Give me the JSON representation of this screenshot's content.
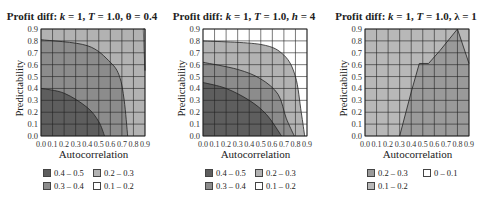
{
  "colors": {
    "0.4-0.5": "#5e5e5e",
    "0.3-0.4": "#8c8c8c",
    "0.2-0.3": "#b2b2b2",
    "0.1-0.2": "#ffffff",
    "0-0.1": "#ffffff",
    "panel3_0.2-0.3": "#9a9a9a",
    "panel3_0.1-0.2": "#b8b8b8"
  },
  "panels": [
    {
      "title_prefix": "Profit diff: ",
      "title_k": "k",
      "title_k_val": " = 1, ",
      "title_T": "T",
      "title_T_val": " = 1.0, ",
      "title_param": "θ",
      "title_param_val": " = 0.4",
      "xlabel": "Autocorrelation",
      "ylabel": "Predictability",
      "legend": [
        {
          "label": "0.4 – 0.5",
          "color": "#5e5e5e"
        },
        {
          "label": "0.2 – 0.3",
          "color": "#b2b2b2"
        },
        {
          "label": "0.3 – 0.4",
          "color": "#8c8c8c"
        },
        {
          "label": "0.1 – 0.2",
          "color": "#ffffff"
        }
      ]
    },
    {
      "title_prefix": "Profit diff: ",
      "title_k": "k",
      "title_k_val": " = 1, ",
      "title_T": "T",
      "title_T_val": " = 1.0, ",
      "title_param": "h",
      "title_param_val": " = 4",
      "xlabel": "Autocorrelation",
      "ylabel": "Predictability",
      "legend": [
        {
          "label": "0.4 – 0.5",
          "color": "#5e5e5e"
        },
        {
          "label": "0.2 – 0.3",
          "color": "#b2b2b2"
        },
        {
          "label": "0.3 – 0.4",
          "color": "#8c8c8c"
        },
        {
          "label": "0.1 – 0.2",
          "color": "#ffffff"
        }
      ]
    },
    {
      "title_prefix": "Profit diff: ",
      "title_k": "k",
      "title_k_val": " = 1, ",
      "title_T": "T",
      "title_T_val": " = 1.0, ",
      "title_param": "λ",
      "title_param_val": " = 1",
      "xlabel": "Autocorrelation",
      "ylabel": "Predictability",
      "legend": [
        {
          "label": "0.2 – 0.3",
          "color": "#9a9a9a"
        },
        {
          "label": "0 – 0.1",
          "color": "#ffffff"
        },
        {
          "label": "0.1 – 0.2",
          "color": "#b8b8b8"
        }
      ]
    }
  ],
  "ticks": [
    "0.0",
    "0.1",
    "0.2",
    "0.3",
    "0.4",
    "0.5",
    "0.6",
    "0.7",
    "0.8",
    "0.9"
  ],
  "chart_data": [
    {
      "type": "heatmap",
      "title": "Profit diff: k = 1, T = 1.0, θ = 0.4",
      "xlabel": "Autocorrelation",
      "ylabel": "Predictability",
      "xlim": [
        0,
        0.9
      ],
      "ylim": [
        0,
        0.9
      ],
      "grid": true,
      "legend_position": "bottom",
      "levels": [
        "0.4 – 0.5",
        "0.3 – 0.4",
        "0.2 – 0.3",
        "0.1 – 0.2"
      ],
      "contours": [
        {
          "level": "0.4 – 0.5",
          "boundary": [
            [
              0,
              0.4
            ],
            [
              0.2,
              0.36
            ],
            [
              0.4,
              0.24
            ],
            [
              0.5,
              0.12
            ],
            [
              0.55,
              0
            ]
          ]
        },
        {
          "level": "0.3 – 0.4",
          "boundary": [
            [
              0,
              0.81
            ],
            [
              0.4,
              0.76
            ],
            [
              0.6,
              0.62
            ],
            [
              0.68,
              0.5
            ],
            [
              0.72,
              0.3
            ],
            [
              0.75,
              0
            ]
          ]
        },
        {
          "level": "0.2 – 0.3",
          "boundary": [
            [
              0.88,
              0.9
            ],
            [
              0.89,
              0.7
            ],
            [
              0.9,
              0.5
            ]
          ]
        },
        {
          "level": "0.1 – 0.2",
          "region": "top-right corner sliver"
        }
      ]
    },
    {
      "type": "heatmap",
      "title": "Profit diff: k = 1, T = 1.0, h = 4",
      "xlabel": "Autocorrelation",
      "ylabel": "Predictability",
      "xlim": [
        0,
        0.9
      ],
      "ylim": [
        0,
        0.9
      ],
      "grid": true,
      "legend_position": "bottom",
      "levels": [
        "0.4 – 0.5",
        "0.3 – 0.4",
        "0.2 – 0.3",
        "0.1 – 0.2"
      ],
      "contours": [
        {
          "level": "0.4 – 0.5",
          "boundary": [
            [
              0,
              0.45
            ],
            [
              0.2,
              0.4
            ],
            [
              0.4,
              0.3
            ],
            [
              0.55,
              0.18
            ],
            [
              0.68,
              0
            ]
          ]
        },
        {
          "level": "0.3 – 0.4",
          "boundary": [
            [
              0,
              0.62
            ],
            [
              0.3,
              0.56
            ],
            [
              0.5,
              0.48
            ],
            [
              0.65,
              0.35
            ],
            [
              0.72,
              0.15
            ],
            [
              0.79,
              0
            ]
          ]
        },
        {
          "level": "0.2 – 0.3",
          "boundary": [
            [
              0,
              0.8
            ],
            [
              0.5,
              0.77
            ],
            [
              0.7,
              0.68
            ],
            [
              0.8,
              0.5
            ],
            [
              0.85,
              0.2
            ],
            [
              0.88,
              0
            ]
          ]
        },
        {
          "level": "0.1 – 0.2",
          "region": "remainder"
        }
      ]
    },
    {
      "type": "heatmap",
      "title": "Profit diff: k = 1, T = 1.0, λ = 1",
      "xlabel": "Autocorrelation",
      "ylabel": "Predictability",
      "xlim": [
        0,
        0.9
      ],
      "ylim": [
        0,
        0.9
      ],
      "grid": true,
      "legend_position": "bottom",
      "levels": [
        "0.2 – 0.3",
        "0.1 – 0.2",
        "0 – 0.1"
      ],
      "contours": [
        {
          "level": "0.2 – 0.3",
          "boundary": [
            [
              0.3,
              0
            ],
            [
              0.4,
              0.37
            ],
            [
              0.47,
              0.61
            ],
            [
              0.55,
              0.61
            ],
            [
              0.65,
              0.72
            ],
            [
              0.8,
              0.9
            ],
            [
              0.9,
              0.61
            ]
          ]
        },
        {
          "level": "0.1 – 0.2",
          "region": "left/upper remainder"
        }
      ]
    }
  ]
}
